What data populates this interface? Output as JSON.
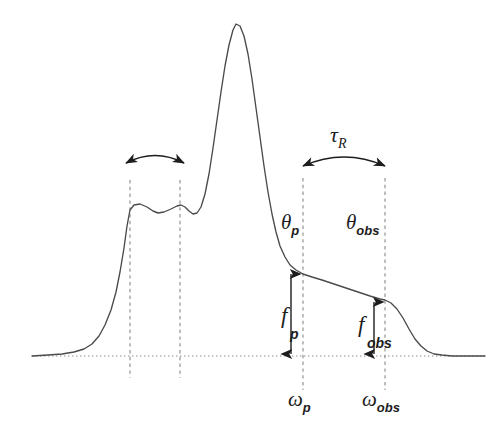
{
  "figure": {
    "kind": "line-shape-spectrum-diagram",
    "background_color": "#ffffff",
    "curve_color": "#4a4a4a",
    "guide_color": "#8a8a8a",
    "annotation_color": "#1d1d1d"
  },
  "labels": {
    "tau_r": {
      "base": "τ",
      "sub": "R"
    },
    "theta_p": {
      "base": "θ",
      "sub": "p"
    },
    "theta_obs": {
      "base": "θ",
      "sub": "obs"
    },
    "omega_p": {
      "base": "ω",
      "sub": "p"
    },
    "omega_obs": {
      "base": "ω",
      "sub": "obs"
    },
    "f_p": {
      "base": "f",
      "sub": "p"
    },
    "f_obs": {
      "base": "f",
      "sub": "obs"
    }
  },
  "chart_data": {
    "type": "line",
    "title": "",
    "xlabel": "",
    "ylabel": "",
    "grid": false,
    "legend": false,
    "axis_visible": false,
    "baseline_y": 356,
    "xlim": [
      32,
      485
    ],
    "ylim_pixels": [
      24,
      356
    ],
    "series": [
      {
        "name": "spectral line shape",
        "points": [
          [
            32,
            356
          ],
          [
            48,
            355
          ],
          [
            62,
            354
          ],
          [
            74,
            352
          ],
          [
            84,
            349
          ],
          [
            92,
            344
          ],
          [
            99,
            336
          ],
          [
            105,
            325
          ],
          [
            111,
            310
          ],
          [
            116,
            292
          ],
          [
            120,
            272
          ],
          [
            124,
            248
          ],
          [
            127,
            226
          ],
          [
            130,
            210
          ],
          [
            134,
            205
          ],
          [
            140,
            204
          ],
          [
            147,
            207
          ],
          [
            153,
            211
          ],
          [
            158,
            213
          ],
          [
            164,
            212
          ],
          [
            171,
            209
          ],
          [
            177,
            206
          ],
          [
            181,
            205
          ],
          [
            185,
            207
          ],
          [
            189,
            211
          ],
          [
            193,
            214
          ],
          [
            197,
            213
          ],
          [
            201,
            207
          ],
          [
            205,
            194
          ],
          [
            209,
            174
          ],
          [
            213,
            148
          ],
          [
            217,
            120
          ],
          [
            221,
            92
          ],
          [
            225,
            66
          ],
          [
            229,
            45
          ],
          [
            233,
            30
          ],
          [
            236,
            24
          ],
          [
            240,
            26
          ],
          [
            244,
            36
          ],
          [
            248,
            54
          ],
          [
            252,
            79
          ],
          [
            256,
            108
          ],
          [
            260,
            137
          ],
          [
            264,
            166
          ],
          [
            268,
            192
          ],
          [
            272,
            214
          ],
          [
            276,
            232
          ],
          [
            280,
            246
          ],
          [
            285,
            257
          ],
          [
            290,
            265
          ],
          [
            296,
            270
          ],
          [
            303,
            274
          ],
          [
            312,
            277
          ],
          [
            322,
            280
          ],
          [
            334,
            284
          ],
          [
            346,
            288
          ],
          [
            358,
            292
          ],
          [
            370,
            296
          ],
          [
            380,
            299
          ],
          [
            385,
            300
          ],
          [
            391,
            303
          ],
          [
            397,
            309
          ],
          [
            403,
            318
          ],
          [
            409,
            329
          ],
          [
            415,
            339
          ],
          [
            421,
            346
          ],
          [
            427,
            351
          ],
          [
            434,
            354
          ],
          [
            442,
            355
          ],
          [
            452,
            356
          ],
          [
            465,
            356
          ],
          [
            485,
            356
          ]
        ]
      }
    ],
    "guides": {
      "baseline": {
        "x1": 32,
        "x2": 485,
        "y": 356,
        "style": "dotted"
      },
      "vertical_dashed": [
        {
          "name": "left-shoulder-left",
          "x": 130,
          "y1": 180,
          "y2": 378
        },
        {
          "name": "left-shoulder-right",
          "x": 180,
          "y1": 180,
          "y2": 378
        },
        {
          "name": "theta-p-line",
          "x": 303,
          "y1": 178,
          "y2": 390
        },
        {
          "name": "theta-obs-line",
          "x": 385,
          "y1": 178,
          "y2": 390
        }
      ]
    },
    "annotations": [
      {
        "name": "left-shoulder-span-arrow",
        "type": "curved-double-arrow",
        "x1": 126,
        "x2": 184,
        "y": 160,
        "sag": 10,
        "label": ""
      },
      {
        "name": "tau-r-span-arrow",
        "type": "curved-double-arrow",
        "x1": 303,
        "x2": 385,
        "y": 162,
        "sag": 12,
        "label": "τR"
      },
      {
        "name": "f-p-arrow",
        "type": "vertical-double-arrow",
        "x": 291,
        "y1": 272,
        "y2": 356,
        "label": "fp"
      },
      {
        "name": "f-obs-arrow",
        "type": "vertical-double-arrow",
        "x": 374,
        "y1": 300,
        "y2": 356,
        "label": "fobs"
      }
    ]
  }
}
